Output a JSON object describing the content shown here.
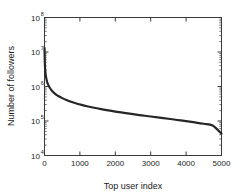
{
  "chart_data": {
    "type": "line",
    "title": "",
    "subtitle": "",
    "xlabel": "Top user index",
    "ylabel": "Number of followers",
    "xlim": [
      0,
      5000
    ],
    "ylim": [
      10000,
      100000000
    ],
    "yscale": "log",
    "xscale": "linear",
    "grid": false,
    "legend": null,
    "xticks": [
      0,
      1000,
      2000,
      3000,
      4000,
      5000
    ],
    "xtick_labels": [
      "0",
      "1000",
      "2000",
      "3000",
      "4000",
      "5000"
    ],
    "yticks": [
      10000,
      100000,
      1000000,
      10000000,
      100000000
    ],
    "ytick_labels": [
      "10",
      "10",
      "10",
      "10",
      "10"
    ],
    "ytick_exponents": [
      "4",
      "5",
      "6",
      "7",
      "8"
    ],
    "series": [
      {
        "name": "followers",
        "color": "#262626",
        "linewidth": 2.2,
        "x": [
          1,
          5,
          10,
          20,
          35,
          50,
          75,
          100,
          140,
          190,
          250,
          320,
          400,
          500,
          620,
          750,
          900,
          1050,
          1200,
          1400,
          1600,
          1800,
          2000,
          2250,
          2500,
          2750,
          3000,
          3250,
          3500,
          3750,
          4000,
          4250,
          4500,
          4750,
          5000
        ],
        "y": [
          13000000,
          7000000,
          4600000,
          3000000,
          2150000,
          1750000,
          1350000,
          1150000,
          950000,
          800000,
          680000,
          590000,
          520000,
          460000,
          405000,
          360000,
          322000,
          292000,
          268000,
          242000,
          221000,
          203000,
          188000,
          172000,
          158000,
          146000,
          135000,
          125000,
          116000,
          107000,
          99000,
          91000,
          83000,
          74000,
          43000
        ]
      }
    ]
  },
  "axes": {
    "y_axis_name": "Number of followers",
    "x_axis_name": "Top user index"
  }
}
